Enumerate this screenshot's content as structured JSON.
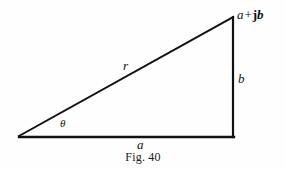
{
  "figure": {
    "caption": "Fig. 40",
    "background_color": "#fefefe",
    "stroke_color": "#111111",
    "labels": {
      "hypotenuse": "r",
      "angle": "θ",
      "base": "a",
      "vertical": "b",
      "apex_real": "a",
      "apex_operator": "+",
      "apex_imag_unit": "j",
      "apex_imag": "b",
      "apex_full": "a + jb"
    },
    "geometry": {
      "left_vertex": {
        "x": 19,
        "y": 137
      },
      "right_vertex": {
        "x": 233,
        "y": 137
      },
      "apex_vertex": {
        "x": 233,
        "y": 17
      },
      "stroke_width": 2
    }
  }
}
